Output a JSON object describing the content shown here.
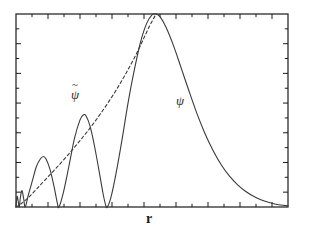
{
  "figure": {
    "background_color": "#ffffff",
    "frame_color": "#1a1a1a",
    "curve_color": "#3a3a3a"
  },
  "axes": {
    "x_label": "r",
    "y_label": "",
    "frame": {
      "left": 16,
      "top": 14,
      "right": 288,
      "bottom": 207
    },
    "x_ticks_count": 17,
    "y_ticks_count": 13,
    "tick_direction": "inward",
    "tick_labels_shown": false
  },
  "labels": {
    "pseudo_wavefunction": "ψ",
    "pseudo_wavefunction_accent": "~",
    "all_electron_wavefunction": "ψ"
  },
  "chart_data": {
    "type": "line",
    "title": "",
    "xlabel": "r",
    "ylabel": "",
    "xlim": [
      0,
      1
    ],
    "ylim": [
      0,
      1
    ],
    "grid": false,
    "legend": "inline-annotations",
    "series": [
      {
        "name": "ψ",
        "style": "solid",
        "color": "#3a3a3a",
        "points": [
          [
            0.0,
            0.0
          ],
          [
            0.004,
            0.055
          ],
          [
            0.008,
            0.03
          ],
          [
            0.012,
            0.0
          ],
          [
            0.016,
            0.048
          ],
          [
            0.022,
            0.085
          ],
          [
            0.028,
            0.045
          ],
          [
            0.034,
            0.0
          ],
          [
            0.045,
            0.06
          ],
          [
            0.06,
            0.135
          ],
          [
            0.075,
            0.21
          ],
          [
            0.09,
            0.25
          ],
          [
            0.1,
            0.262
          ],
          [
            0.11,
            0.25
          ],
          [
            0.125,
            0.195
          ],
          [
            0.14,
            0.105
          ],
          [
            0.152,
            0.02
          ],
          [
            0.158,
            0.0
          ],
          [
            0.175,
            0.08
          ],
          [
            0.195,
            0.215
          ],
          [
            0.215,
            0.355
          ],
          [
            0.235,
            0.45
          ],
          [
            0.248,
            0.478
          ],
          [
            0.258,
            0.47
          ],
          [
            0.272,
            0.42
          ],
          [
            0.288,
            0.32
          ],
          [
            0.305,
            0.19
          ],
          [
            0.32,
            0.07
          ],
          [
            0.33,
            0.008
          ],
          [
            0.336,
            0.0
          ],
          [
            0.35,
            0.055
          ],
          [
            0.368,
            0.175
          ],
          [
            0.39,
            0.35
          ],
          [
            0.412,
            0.54
          ],
          [
            0.435,
            0.71
          ],
          [
            0.458,
            0.855
          ],
          [
            0.48,
            0.95
          ],
          [
            0.5,
            0.995
          ],
          [
            0.515,
            1.0
          ],
          [
            0.53,
            0.985
          ],
          [
            0.552,
            0.93
          ],
          [
            0.578,
            0.84
          ],
          [
            0.605,
            0.73
          ],
          [
            0.635,
            0.605
          ],
          [
            0.665,
            0.485
          ],
          [
            0.695,
            0.38
          ],
          [
            0.725,
            0.292
          ],
          [
            0.755,
            0.218
          ],
          [
            0.785,
            0.16
          ],
          [
            0.815,
            0.115
          ],
          [
            0.845,
            0.08
          ],
          [
            0.875,
            0.054
          ],
          [
            0.905,
            0.035
          ],
          [
            0.935,
            0.022
          ],
          [
            0.96,
            0.013
          ],
          [
            1.0,
            0.006
          ]
        ]
      },
      {
        "name": "ψ̃",
        "style": "dashed",
        "color": "#3a3a3a",
        "points": [
          [
            0.0,
            0.0
          ],
          [
            0.02,
            0.018
          ],
          [
            0.045,
            0.048
          ],
          [
            0.075,
            0.092
          ],
          [
            0.11,
            0.145
          ],
          [
            0.15,
            0.205
          ],
          [
            0.19,
            0.268
          ],
          [
            0.23,
            0.335
          ],
          [
            0.27,
            0.405
          ],
          [
            0.31,
            0.482
          ],
          [
            0.35,
            0.565
          ],
          [
            0.385,
            0.645
          ],
          [
            0.415,
            0.72
          ],
          [
            0.445,
            0.8
          ],
          [
            0.47,
            0.875
          ],
          [
            0.49,
            0.935
          ],
          [
            0.505,
            0.975
          ],
          [
            0.515,
            1.0
          ]
        ]
      }
    ]
  }
}
